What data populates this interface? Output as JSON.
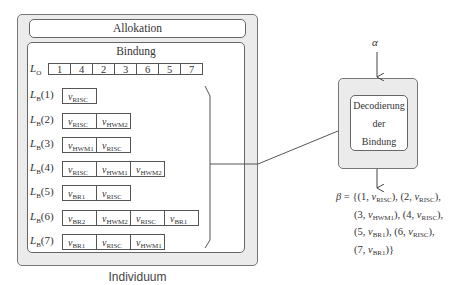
{
  "individuum": {
    "caption": "Individuum",
    "allokation_label": "Allokation",
    "bindung": {
      "title": "Bindung",
      "lo_label": "L",
      "lo_sub": "O",
      "lo_values": [
        "1",
        "4",
        "2",
        "3",
        "6",
        "5",
        "7"
      ],
      "lb_rows": [
        {
          "label": "L",
          "sub": "B",
          "index": "(1)",
          "cells": [
            {
              "v": "v",
              "s": "RISC"
            }
          ]
        },
        {
          "label": "L",
          "sub": "B",
          "index": "(2)",
          "cells": [
            {
              "v": "v",
              "s": "RISC"
            },
            {
              "v": "v",
              "s": "HWM2"
            }
          ]
        },
        {
          "label": "L",
          "sub": "B",
          "index": "(3)",
          "cells": [
            {
              "v": "v",
              "s": "HWM1"
            },
            {
              "v": "v",
              "s": "RISC"
            }
          ]
        },
        {
          "label": "L",
          "sub": "B",
          "index": "(4)",
          "cells": [
            {
              "v": "v",
              "s": "RISC"
            },
            {
              "v": "v",
              "s": "HWM1"
            },
            {
              "v": "v",
              "s": "HWM2"
            }
          ]
        },
        {
          "label": "L",
          "sub": "B",
          "index": "(5)",
          "cells": [
            {
              "v": "v",
              "s": "BR1"
            },
            {
              "v": "v",
              "s": "RISC"
            }
          ]
        },
        {
          "label": "L",
          "sub": "B",
          "index": "(6)",
          "cells": [
            {
              "v": "v",
              "s": "BR2"
            },
            {
              "v": "v",
              "s": "HWM2"
            },
            {
              "v": "v",
              "s": "RISC"
            },
            {
              "v": "v",
              "s": "BR1"
            }
          ]
        },
        {
          "label": "L",
          "sub": "B",
          "index": "(7)",
          "cells": [
            {
              "v": "v",
              "s": "BR1"
            },
            {
              "v": "v",
              "s": "RISC"
            },
            {
              "v": "v",
              "s": "HWM1"
            }
          ]
        }
      ]
    }
  },
  "decoder": {
    "input_symbol": "α",
    "lines": [
      "Decodierung",
      "der",
      "Bindung"
    ]
  },
  "result": {
    "symbol": "β",
    "lines": [
      "β = {(1, v_RISC), (2, v_RISC),",
      "(3, v_HWM1), (4, v_RISC),",
      "(5, v_BR1), (6, v_RISC),",
      "(7, v_BR1)}"
    ],
    "pairs": [
      {
        "n": "1",
        "s": "RISC"
      },
      {
        "n": "2",
        "s": "RISC"
      },
      {
        "n": "3",
        "s": "HWM1"
      },
      {
        "n": "4",
        "s": "RISC"
      },
      {
        "n": "5",
        "s": "BR1"
      },
      {
        "n": "6",
        "s": "RISC"
      },
      {
        "n": "7",
        "s": "BR1"
      }
    ]
  }
}
